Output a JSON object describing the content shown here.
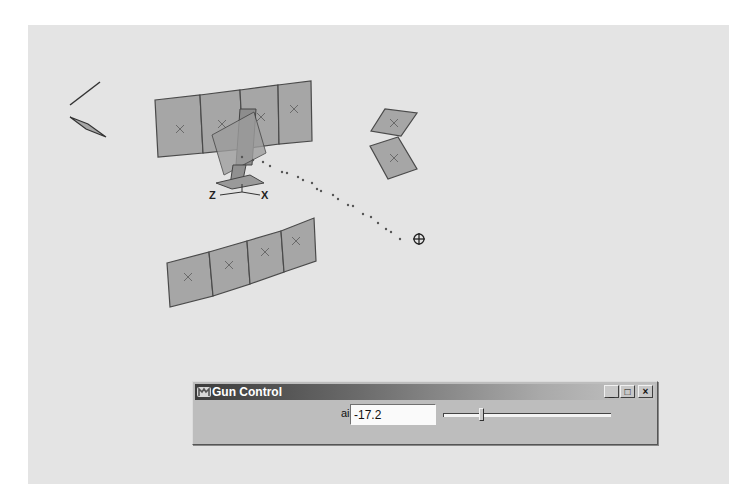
{
  "viewport": {
    "background": "#e4e4e4",
    "panel_fill": "#a6a6a6",
    "panel_stroke": "#4a4a4a",
    "marker_color": "#6a6a6a",
    "panel_groups": [
      {
        "name": "upper-panel-row",
        "panels": [
          {
            "points": "127,75 172,70 175,128 130,132",
            "cx": 152,
            "cy": 104
          },
          {
            "points": "172,70 212,65 215,124 175,128",
            "cx": 194,
            "cy": 99
          },
          {
            "points": "212,65 250,60 251,119 215,124",
            "cx": 233,
            "cy": 92
          },
          {
            "points": "250,60 283,56 284,116 251,119",
            "cx": 266,
            "cy": 84
          }
        ]
      },
      {
        "name": "lower-panel-row",
        "panels": [
          {
            "points": "139,238 181,227 185,271 142,282",
            "cx": 160,
            "cy": 252
          },
          {
            "points": "181,227 219,216 222,259 185,271",
            "cx": 201,
            "cy": 240
          },
          {
            "points": "219,216 253,206 256,247 222,259",
            "cx": 237,
            "cy": 227
          },
          {
            "points": "253,206 286,193 288,236 256,247",
            "cx": 268,
            "cy": 216
          }
        ]
      },
      {
        "name": "right-panel-pair",
        "panels": [
          {
            "points": "343,106 357,84 389,88 373,111",
            "cx": 366,
            "cy": 98
          },
          {
            "points": "370,112 342,121 360,154 389,144",
            "cx": 366,
            "cy": 133
          }
        ]
      }
    ],
    "left_gizmo": {
      "line": "42,80 72,57",
      "diamond": "42,92 60,99 78,112 58,104"
    },
    "rig": {
      "parts": [
        {
          "points": "212,84 228,84 224,140 208,140",
          "fill": "#8d8d8d"
        },
        {
          "points": "184,110 226,87 238,128 196,150",
          "fill": "#9d9d9d",
          "opacity": "0.8"
        },
        {
          "points": "205,140 218,140 214,160 202,160",
          "fill": "#909090"
        },
        {
          "points": "188,158 222,150 236,158 204,164",
          "fill": "#9a9a9a"
        }
      ],
      "axes": {
        "z_label": "Z",
        "x_label": "X",
        "origin": [
          214,
          167
        ]
      }
    },
    "trajectory": {
      "dots": [
        [
          214,
          132
        ],
        [
          225,
          135
        ],
        [
          235,
          137
        ],
        [
          242,
          141
        ],
        [
          254,
          147
        ],
        [
          259,
          148
        ],
        [
          270,
          152
        ],
        [
          275,
          155
        ],
        [
          284,
          158
        ],
        [
          289,
          164
        ],
        [
          293,
          166
        ],
        [
          305,
          170
        ],
        [
          310,
          174
        ],
        [
          320,
          180
        ],
        [
          325,
          181
        ],
        [
          335,
          189
        ],
        [
          343,
          192
        ],
        [
          350,
          198
        ],
        [
          358,
          204
        ],
        [
          363,
          207
        ],
        [
          372,
          214
        ]
      ],
      "target": {
        "cx": 391,
        "cy": 214,
        "r": 5
      }
    }
  },
  "dialog": {
    "title": "Gun Control",
    "buttons": {
      "minimize": "_",
      "maximize": "□",
      "close": "×"
    },
    "aim_label": "aim",
    "aim_value": "-17.2",
    "slider": {
      "min": 0,
      "max": 100,
      "value": 22
    }
  }
}
